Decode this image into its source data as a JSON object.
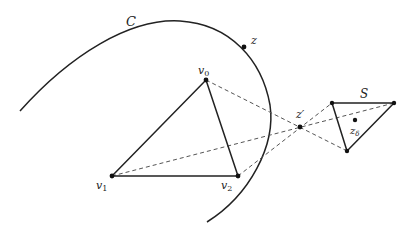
{
  "diagram": {
    "type": "geometric-construction",
    "colors": {
      "stroke": "#222222",
      "dashed": "#555555",
      "background": "#ffffff"
    },
    "labels": {
      "curve": "C",
      "curve_point": "z",
      "v0_base": "v",
      "v0_sub": "0",
      "v1_base": "v",
      "v1_sub": "1",
      "v2_base": "v",
      "v2_sub": "2",
      "center": "z′",
      "small_triangle": "S",
      "delta_point_base": "z",
      "delta_point_sub": "δ"
    },
    "points": {
      "v0": [
        206,
        80
      ],
      "v1": [
        112,
        176
      ],
      "v2": [
        238,
        176
      ],
      "z_prime": [
        300,
        127
      ],
      "z": [
        244,
        47
      ],
      "z_delta": [
        355,
        120
      ],
      "S_a": [
        332,
        103
      ],
      "S_b": [
        394,
        103
      ],
      "S_c": [
        347,
        151
      ]
    },
    "edges": {
      "solid": [
        [
          "v0",
          "v1"
        ],
        [
          "v1",
          "v2"
        ],
        [
          "v2",
          "v0"
        ],
        [
          "S_a",
          "S_b"
        ],
        [
          "S_b",
          "S_c"
        ],
        [
          "S_c",
          "S_a"
        ]
      ],
      "dashed": [
        [
          "v0",
          "S_c"
        ],
        [
          "v1",
          "S_b"
        ],
        [
          "v2",
          "S_a"
        ]
      ]
    }
  }
}
